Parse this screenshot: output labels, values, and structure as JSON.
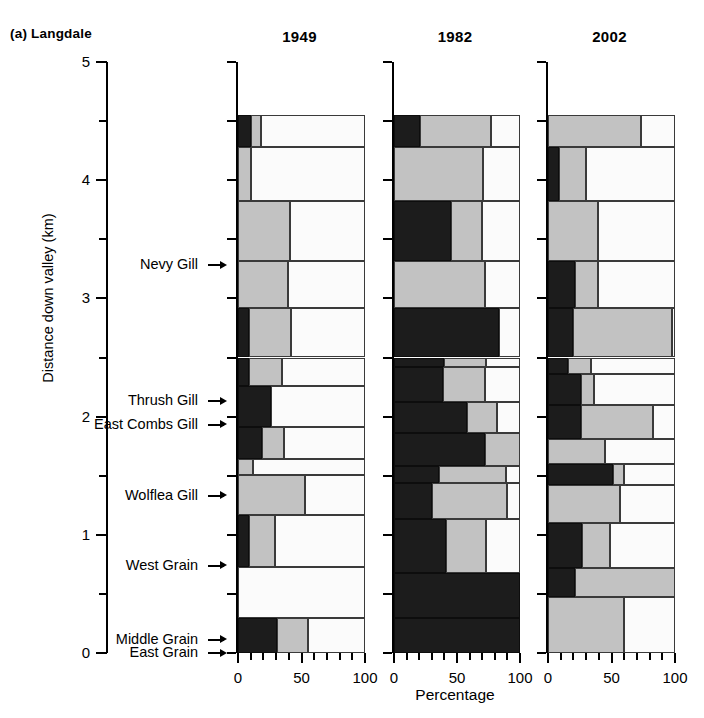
{
  "figure": {
    "panel_letter": "(a)",
    "site_name": "Langdale",
    "label": "(a)  Langdale"
  },
  "yaxis": {
    "title": "Distance down valley (km)",
    "ticks": [
      0,
      1,
      2,
      3,
      4,
      5
    ],
    "tick_labels": [
      "0",
      "1",
      "2",
      "3",
      "4",
      "5"
    ],
    "minor_ticks": [
      0.5,
      1.5,
      2.5,
      3.5,
      4.5
    ],
    "range": [
      0,
      5
    ],
    "units": "km"
  },
  "xaxis": {
    "title": "Percentage",
    "ticks": [
      0,
      50,
      100
    ],
    "tick_labels": [
      "0",
      "50",
      "100"
    ],
    "minor_ticks": [
      10,
      20,
      30,
      40,
      60,
      70,
      80,
      90
    ],
    "range": [
      0,
      100
    ]
  },
  "legend": {
    "categories": [
      "dark",
      "gray",
      "light"
    ],
    "colors": [
      "#1c1c1c",
      "#c2c2c2",
      "#fbfbfb"
    ]
  },
  "panels": [
    {
      "title": "1949"
    },
    {
      "title": "1982"
    },
    {
      "title": "2002"
    }
  ],
  "tributaries": [
    {
      "label": "Nevy Gill",
      "distance_km": 3.28
    },
    {
      "label": "Thrush Gill",
      "distance_km": 2.13
    },
    {
      "label": "East Combs Gill",
      "distance_km": 1.93
    },
    {
      "label": "Wolflea Gill",
      "distance_km": 1.33
    },
    {
      "label": "West Grain",
      "distance_km": 0.74
    },
    {
      "label": "Middle Grain",
      "distance_km": 0.11
    },
    {
      "label": "East Grain",
      "distance_km": 0.0
    }
  ],
  "chart_data": {
    "type": "bar",
    "orientation": "horizontal",
    "stacked": true,
    "title": "(a)  Langdale",
    "xlabel": "Percentage",
    "ylabel": "Distance down valley (km)",
    "xlim": [
      0,
      100
    ],
    "ylim": [
      0,
      5
    ],
    "grid": false,
    "series": [
      "dark",
      "gray",
      "light"
    ],
    "series_colors": [
      "#1c1c1c",
      "#c2c2c2",
      "#fbfbfb"
    ],
    "panels": [
      {
        "name": "1949",
        "rows": [
          {
            "y0": 4.28,
            "y1": 4.55,
            "values": [
              10,
              8,
              82
            ]
          },
          {
            "y0": 3.82,
            "y1": 4.28,
            "values": [
              0,
              10,
              90
            ]
          },
          {
            "y0": 3.32,
            "y1": 3.82,
            "values": [
              0,
              41,
              59
            ]
          },
          {
            "y0": 2.92,
            "y1": 3.32,
            "values": [
              0,
              39,
              61
            ]
          },
          {
            "y0": 2.5,
            "y1": 2.92,
            "values": [
              9,
              33,
              58
            ]
          },
          {
            "y0": 2.26,
            "y1": 2.5,
            "values": [
              9,
              26,
              65
            ]
          },
          {
            "y0": 1.91,
            "y1": 2.26,
            "values": [
              26,
              0,
              74
            ]
          },
          {
            "y0": 1.64,
            "y1": 1.91,
            "values": [
              19,
              17,
              64
            ]
          },
          {
            "y0": 1.51,
            "y1": 1.64,
            "values": [
              0,
              12,
              88
            ]
          },
          {
            "y0": 1.17,
            "y1": 1.51,
            "values": [
              0,
              53,
              47
            ]
          },
          {
            "y0": 0.73,
            "y1": 1.17,
            "values": [
              9,
              20,
              71
            ]
          },
          {
            "y0": 0.3,
            "y1": 0.73,
            "values": [
              0,
              0,
              100
            ]
          },
          {
            "y0": 0.0,
            "y1": 0.3,
            "values": [
              31,
              24,
              45
            ]
          }
        ]
      },
      {
        "name": "1982",
        "rows": [
          {
            "y0": 4.28,
            "y1": 4.55,
            "values": [
              21,
              56,
              23
            ]
          },
          {
            "y0": 3.82,
            "y1": 4.28,
            "values": [
              0,
              71,
              29
            ]
          },
          {
            "y0": 3.32,
            "y1": 3.82,
            "values": [
              45,
              25,
              30
            ]
          },
          {
            "y0": 2.92,
            "y1": 3.32,
            "values": [
              0,
              72,
              28
            ]
          },
          {
            "y0": 2.5,
            "y1": 2.92,
            "values": [
              83,
              0,
              17
            ]
          },
          {
            "y0": 2.42,
            "y1": 2.5,
            "values": [
              40,
              33,
              27
            ]
          },
          {
            "y0": 2.12,
            "y1": 2.42,
            "values": [
              39,
              33,
              28
            ]
          },
          {
            "y0": 1.86,
            "y1": 2.12,
            "values": [
              58,
              24,
              18
            ]
          },
          {
            "y0": 1.58,
            "y1": 1.86,
            "values": [
              72,
              28,
              0
            ]
          },
          {
            "y0": 1.44,
            "y1": 1.58,
            "values": [
              36,
              53,
              11
            ]
          },
          {
            "y0": 1.13,
            "y1": 1.44,
            "values": [
              30,
              60,
              10
            ]
          },
          {
            "y0": 0.68,
            "y1": 1.13,
            "values": [
              41,
              32,
              27
            ]
          },
          {
            "y0": 0.3,
            "y1": 0.68,
            "values": [
              100,
              0,
              0
            ]
          },
          {
            "y0": 0.0,
            "y1": 0.3,
            "values": [
              100,
              0,
              0
            ]
          }
        ]
      },
      {
        "name": "2002",
        "rows": [
          {
            "y0": 4.28,
            "y1": 4.55,
            "values": [
              0,
              73,
              27
            ]
          },
          {
            "y0": 3.82,
            "y1": 4.28,
            "values": [
              9,
              21,
              70
            ]
          },
          {
            "y0": 3.32,
            "y1": 3.82,
            "values": [
              0,
              39,
              61
            ]
          },
          {
            "y0": 2.92,
            "y1": 3.32,
            "values": [
              21,
              18,
              61
            ]
          },
          {
            "y0": 2.5,
            "y1": 2.92,
            "values": [
              20,
              78,
              2
            ]
          },
          {
            "y0": 2.36,
            "y1": 2.5,
            "values": [
              16,
              18,
              66
            ]
          },
          {
            "y0": 2.1,
            "y1": 2.36,
            "values": [
              26,
              10,
              64
            ]
          },
          {
            "y0": 1.81,
            "y1": 2.1,
            "values": [
              26,
              57,
              17
            ]
          },
          {
            "y0": 1.6,
            "y1": 1.81,
            "values": [
              0,
              45,
              55
            ]
          },
          {
            "y0": 1.42,
            "y1": 1.6,
            "values": [
              51,
              9,
              40
            ]
          },
          {
            "y0": 1.1,
            "y1": 1.42,
            "values": [
              0,
              57,
              43
            ]
          },
          {
            "y0": 0.72,
            "y1": 1.1,
            "values": [
              27,
              22,
              51
            ]
          },
          {
            "y0": 0.47,
            "y1": 0.72,
            "values": [
              21,
              79,
              0
            ]
          },
          {
            "y0": 0.0,
            "y1": 0.47,
            "values": [
              0,
              60,
              40
            ]
          }
        ]
      }
    ]
  }
}
